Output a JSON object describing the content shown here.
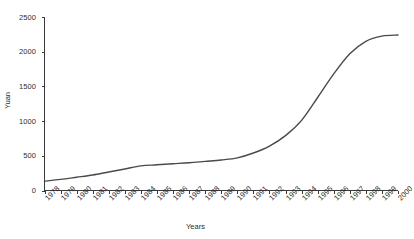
{
  "chart_data": {
    "type": "line",
    "title": "",
    "xlabel": "Years",
    "ylabel": "Yuan",
    "xlim": [
      1978,
      2000
    ],
    "ylim": [
      0,
      2500
    ],
    "yticks": [
      0,
      500,
      1000,
      1500,
      2000,
      2500
    ],
    "ytick_labels": [
      "0",
      "500",
      "1000",
      "1500",
      "2000",
      "2500"
    ],
    "grid": false,
    "legend": null,
    "categories": [
      "1978",
      "1979",
      "1980",
      "1981",
      "1982",
      "1983",
      "1984",
      "1985",
      "1986",
      "1987",
      "1988",
      "1989",
      "1990",
      "1991",
      "1992",
      "1993",
      "1994",
      "1995",
      "1996",
      "1997",
      "1998",
      "1999",
      "2000"
    ],
    "x": [
      1978,
      1979,
      1980,
      1981,
      1982,
      1983,
      1984,
      1985,
      1986,
      1987,
      1988,
      1989,
      1990,
      1991,
      1992,
      1993,
      1994,
      1995,
      1996,
      1997,
      1998,
      1999,
      2000
    ],
    "values": [
      134,
      160,
      191,
      223,
      267,
      310,
      355,
      370,
      385,
      400,
      420,
      440,
      470,
      540,
      640,
      790,
      1010,
      1340,
      1680,
      1970,
      2150,
      2225,
      2240
    ],
    "series": [
      {
        "name": "Yuan",
        "color": "#4a4a4a",
        "values": [
          134,
          160,
          191,
          223,
          267,
          310,
          355,
          370,
          385,
          400,
          420,
          440,
          470,
          540,
          640,
          790,
          1010,
          1340,
          1680,
          1970,
          2150,
          2225,
          2240
        ]
      }
    ]
  }
}
